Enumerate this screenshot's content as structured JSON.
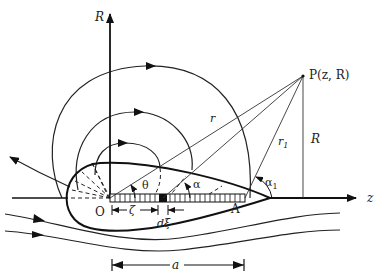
{
  "diagram": {
    "labels": {
      "r_axis": "R",
      "z_axis": "z",
      "origin": "O",
      "end_point": "A",
      "field_point": "P(z, R)",
      "distance_r": "r",
      "distance_r1": "r",
      "distance_r1_sub": "1",
      "height_R": "R",
      "angle_theta": "θ",
      "angle_alpha": "α",
      "angle_alpha1": "α",
      "angle_alpha1_sub": "1",
      "zeta": "ζ",
      "d_xi": "dξ",
      "length_a": "a"
    },
    "colors": {
      "stroke": "#111111",
      "thin_stroke": "#333333",
      "background": "#ffffff"
    }
  }
}
